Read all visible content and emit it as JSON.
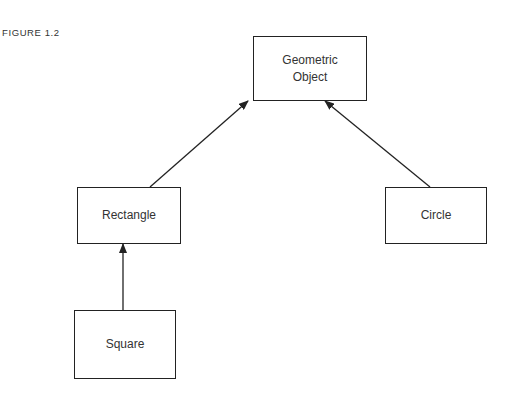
{
  "figure_label": "FIGURE 1.2",
  "nodes": {
    "geometric_object": {
      "line1": "Geometric",
      "line2": "Object"
    },
    "rectangle": {
      "label": "Rectangle"
    },
    "circle": {
      "label": "Circle"
    },
    "square": {
      "label": "Square"
    }
  },
  "edges": [
    {
      "from": "Rectangle",
      "to": "Geometric Object"
    },
    {
      "from": "Circle",
      "to": "Geometric Object"
    },
    {
      "from": "Square",
      "to": "Rectangle"
    }
  ],
  "colors": {
    "stroke": "#222222",
    "text": "#333333",
    "background": "#ffffff"
  }
}
